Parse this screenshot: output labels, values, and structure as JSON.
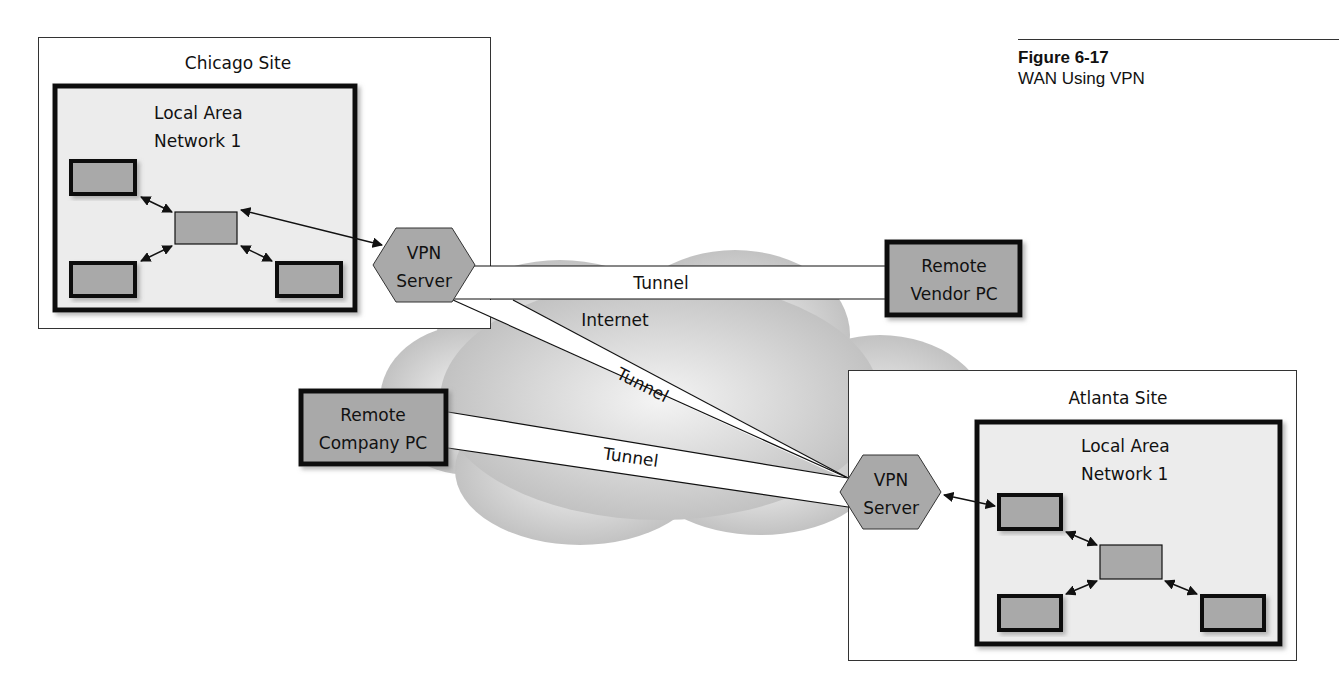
{
  "figure": {
    "number": "Figure 6-17",
    "title": "WAN Using VPN"
  },
  "sites": {
    "chicago": {
      "title": "Chicago Site",
      "lan_line1": "Local Area",
      "lan_line2": "Network 1",
      "vpn_line1": "VPN",
      "vpn_line2": "Server"
    },
    "atlanta": {
      "title": "Atlanta Site",
      "lan_line1": "Local Area",
      "lan_line2": "Network 1",
      "vpn_line1": "VPN",
      "vpn_line2": "Server"
    }
  },
  "remote_nodes": {
    "vendor_pc": {
      "line1": "Remote",
      "line2": "Vendor PC"
    },
    "company_pc": {
      "line1": "Remote",
      "line2": "Company PC"
    }
  },
  "cloud": {
    "label": "Internet"
  },
  "tunnels": {
    "chicago_to_vendor": "Tunnel",
    "chicago_to_atlanta": "Tunnel",
    "company_to_atlanta": "Tunnel"
  },
  "colors": {
    "device_fill": "#a9a9a9",
    "lan_fill": "#ececec",
    "cloud_fill": "#c9c9c9",
    "border": "#111111"
  }
}
